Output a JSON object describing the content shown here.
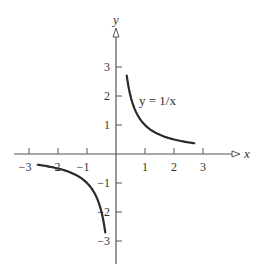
{
  "chart_data": {
    "type": "line",
    "title": "",
    "xlabel": "x",
    "ylabel": "y",
    "xlim": [
      -3.5,
      4.2
    ],
    "ylim": [
      -3.7,
      3.4
    ],
    "grid": false,
    "legend": null,
    "xticks": [
      -3,
      -2,
      -1,
      1,
      2,
      3
    ],
    "yticks": [
      -3,
      -2,
      -1,
      1,
      2,
      3
    ],
    "xtick_labels": [
      "−3",
      "−2",
      "−1",
      "1",
      "2",
      "3"
    ],
    "ytick_labels": [
      "−3",
      "−2",
      "−1",
      "1",
      "2",
      "3"
    ],
    "annotations": [
      {
        "text": "y = 1/x",
        "x": 0.85,
        "y": 2.0
      }
    ],
    "series": [
      {
        "name": "y = 1/x (x > 0)",
        "x": [
          0.37,
          0.5,
          0.75,
          1.0,
          1.5,
          2.0,
          2.7
        ],
        "y": [
          2.7,
          2.0,
          1.333,
          1.0,
          0.667,
          0.5,
          0.37
        ]
      },
      {
        "name": "y = 1/x (x < 0)",
        "x": [
          -2.7,
          -2.0,
          -1.5,
          -1.0,
          -0.75,
          -0.5,
          -0.37
        ],
        "y": [
          -0.37,
          -0.5,
          -0.667,
          -1.0,
          -1.333,
          -2.0,
          -2.7
        ]
      }
    ]
  },
  "layout": {
    "origin_px": [
      116,
      154
    ],
    "unit_px": 29,
    "curve_color": "#2a2a2a",
    "axis_color": "#555555"
  }
}
